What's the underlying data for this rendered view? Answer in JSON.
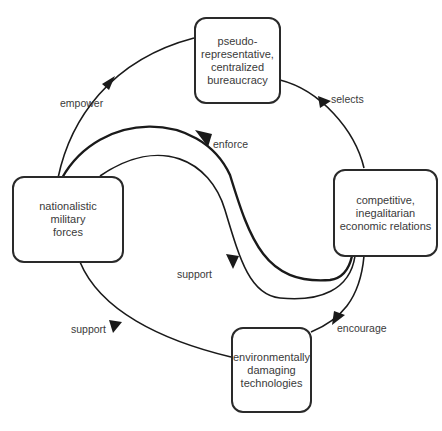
{
  "diagram": {
    "type": "cycle",
    "nodes": {
      "top": {
        "lines": [
          "pseudo-",
          "representative,",
          "centralized",
          "bureaucracy"
        ]
      },
      "right": {
        "lines": [
          "competitive,",
          "inegalitarian",
          "economic relations"
        ]
      },
      "bottom": {
        "lines": [
          "environmentally",
          "damaging",
          "technologies"
        ]
      },
      "left": {
        "lines": [
          "nationalistic",
          "military",
          "forces"
        ]
      }
    },
    "edges": {
      "empower": "empower",
      "selects": "selects",
      "encourage": "encourage",
      "support_outer": "support",
      "enforce": "enforce",
      "support_inner": "support"
    },
    "relations": [
      {
        "from": "left",
        "to": "top",
        "label": "empower"
      },
      {
        "from": "top",
        "to": "right",
        "label": "selects"
      },
      {
        "from": "right",
        "to": "bottom",
        "label": "encourage"
      },
      {
        "from": "bottom",
        "to": "left",
        "label": "support"
      },
      {
        "from": "left",
        "to": "right",
        "label": "enforce"
      },
      {
        "from": "right",
        "to": "left",
        "label": "support"
      }
    ],
    "colors": {
      "stroke": "#1a1a1a",
      "text": "#3a3a3a",
      "background": "#ffffff"
    }
  }
}
